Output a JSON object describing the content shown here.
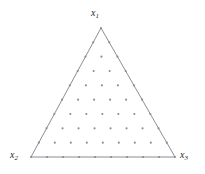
{
  "figure": {
    "name": "ternary-simplex-lattice",
    "background_color": "#ffffff",
    "width": 205,
    "height": 174
  },
  "labels": {
    "top": {
      "base": "x",
      "sub": "1",
      "text": "x1"
    },
    "bottom_left": {
      "base": "x",
      "sub": "2",
      "text": "x2"
    },
    "bottom_right": {
      "base": "x",
      "sub": "3",
      "text": "x3"
    }
  },
  "chart_data": {
    "type": "scatter",
    "title": "",
    "xlabel": "",
    "ylabel": "",
    "plot_style": "ternary-simplex-lattice",
    "lattice_order": 9,
    "lattice_rows": 10,
    "row_point_counts": [
      1,
      2,
      3,
      4,
      5,
      6,
      7,
      8,
      9,
      10
    ],
    "total_points": 55,
    "vertices": {
      "x1": [
        101,
        28
      ],
      "x2": [
        31,
        157
      ],
      "x3": [
        175,
        157
      ]
    },
    "triangle_outline": {
      "stroke_color": "#6e6e78",
      "stroke_width": 0.8,
      "fill": "none"
    },
    "points": {
      "marker": "dot",
      "color": "#8a8a93",
      "radius": 1.05
    },
    "barycentric_coordinates_note": "Each point has barycentric coords (i/9, j/9, k/9) with i+j+k=9",
    "grid": false,
    "legend": false,
    "axis_visible": false
  }
}
